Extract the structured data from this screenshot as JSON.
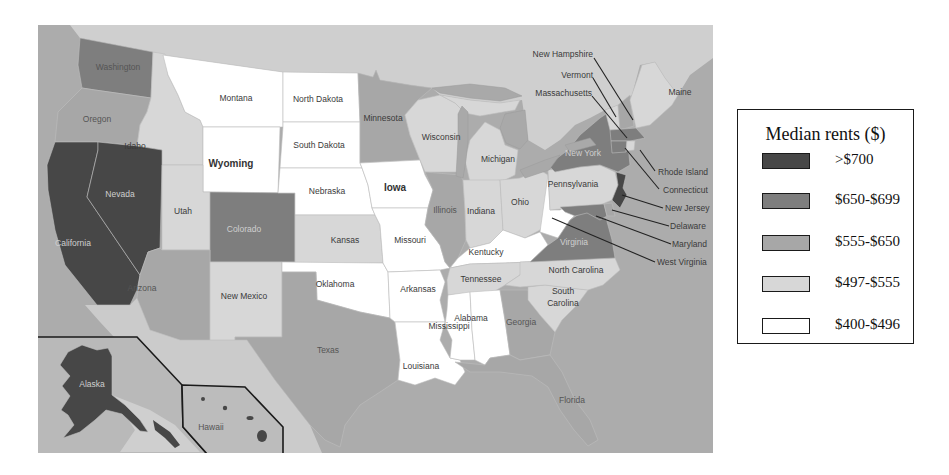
{
  "legend": {
    "title": "Median rents ($)",
    "items": [
      {
        "label": ">$700",
        "color": "#474747"
      },
      {
        "label": "$650-$699",
        "color": "#7e7e7e"
      },
      {
        "label": "$555-$650",
        "color": "#a7a7a7"
      },
      {
        "label": "$497-$555",
        "color": "#d7d7d7"
      },
      {
        "label": "$400-$496",
        "color": "#ffffff"
      }
    ]
  },
  "map": {
    "colors": {
      "ocean": "#acacac",
      "canada": "#cfcfcf",
      "mexico": "#cbcbcb",
      "alaska_inset": "#b9b9b9",
      "hawaii_inset": "#bcbcbc"
    },
    "states": {
      "washington": {
        "label": "Washington",
        "range": "$650-$699"
      },
      "oregon": {
        "label": "Oregon",
        "range": "$555-$650"
      },
      "california": {
        "label": "California",
        "range": ">$700"
      },
      "nevada": {
        "label": "Nevada",
        "range": ">$700"
      },
      "idaho": {
        "label": "Idaho",
        "range": "$497-$555"
      },
      "montana": {
        "label": "Montana",
        "range": "$400-$496"
      },
      "wyoming": {
        "label": "Wyoming",
        "range": "$400-$496"
      },
      "utah": {
        "label": "Utah",
        "range": "$497-$555"
      },
      "colorado": {
        "label": "Colorado",
        "range": "$650-$699"
      },
      "arizona": {
        "label": "Arizona",
        "range": "$555-$650"
      },
      "new_mexico": {
        "label": "New Mexico",
        "range": "$497-$555"
      },
      "north_dakota": {
        "label": "North Dakota",
        "range": "$400-$496"
      },
      "south_dakota": {
        "label": "South Dakota",
        "range": "$400-$496"
      },
      "nebraska": {
        "label": "Nebraska",
        "range": "$400-$496"
      },
      "kansas": {
        "label": "Kansas",
        "range": "$497-$555"
      },
      "oklahoma": {
        "label": "Oklahoma",
        "range": "$400-$496"
      },
      "texas": {
        "label": "Texas",
        "range": "$555-$650"
      },
      "minnesota": {
        "label": "Minnesota",
        "range": "$555-$650"
      },
      "iowa": {
        "label": "Iowa",
        "range": "$400-$496"
      },
      "missouri": {
        "label": "Missouri",
        "range": "$400-$496"
      },
      "arkansas": {
        "label": "Arkansas",
        "range": "$400-$496"
      },
      "louisiana": {
        "label": "Louisiana",
        "range": "$400-$496"
      },
      "wisconsin": {
        "label": "Wisconsin",
        "range": "$497-$555"
      },
      "illinois": {
        "label": "Illinois",
        "range": "$555-$650"
      },
      "michigan": {
        "label": "Michigan",
        "range": "$497-$555"
      },
      "indiana": {
        "label": "Indiana",
        "range": "$497-$555"
      },
      "ohio": {
        "label": "Ohio",
        "range": "$497-$555"
      },
      "kentucky": {
        "label": "Kentucky",
        "range": "$400-$496"
      },
      "tennessee": {
        "label": "Tennessee",
        "range": "$497-$555"
      },
      "mississippi": {
        "label": "Mississippi",
        "range": "$400-$496"
      },
      "alabama": {
        "label": "Alabama",
        "range": "$400-$496"
      },
      "georgia": {
        "label": "Georgia",
        "range": "$555-$650"
      },
      "florida": {
        "label": "Florida",
        "range": "$555-$650"
      },
      "south_carolina": {
        "label_1": "South",
        "label_2": "Carolina",
        "range": "$497-$555"
      },
      "north_carolina": {
        "label": "North Carolina",
        "range": "$497-$555"
      },
      "virginia": {
        "label": "Virginia",
        "range": "$650-$699"
      },
      "west_virginia": {
        "label": "West Virginia",
        "range": "$400-$496"
      },
      "pennsylvania": {
        "label": "Pennsylvania",
        "range": "$497-$555"
      },
      "new_york": {
        "label": "New York",
        "range": "$650-$699"
      },
      "new_jersey": {
        "label": "New Jersey",
        "range": ">$700"
      },
      "delaware": {
        "label": "Delaware",
        "range": "$555-$650"
      },
      "maryland": {
        "label": "Maryland",
        "range": "$650-$699"
      },
      "connecticut": {
        "label": "Connecticut",
        "range": "$650-$699"
      },
      "rhode_island": {
        "label": "Rhode Island",
        "range": "$497-$555"
      },
      "massachusetts": {
        "label": "Massachusetts",
        "range": "$650-$699"
      },
      "new_hampshire": {
        "label": "New Hampshire",
        "range": "$555-$650"
      },
      "vermont": {
        "label": "Vermont",
        "range": "$497-$555"
      },
      "maine": {
        "label": "Maine",
        "range": "$497-$555"
      },
      "alaska": {
        "label": "Alaska",
        "range": ">$700"
      },
      "hawaii": {
        "label": "Hawaii",
        "range": ">$700"
      }
    }
  }
}
